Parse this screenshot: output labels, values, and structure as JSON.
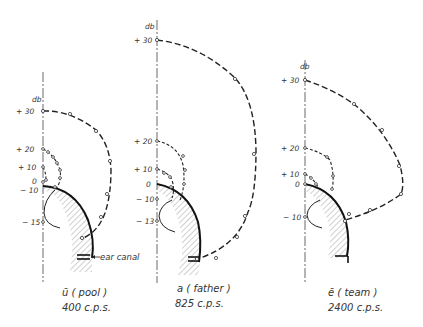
{
  "figure": {
    "unit_label": "db",
    "annotation": "ear canal",
    "panels": [
      {
        "vowel": "ū ( pool )",
        "frequency": "400 c.p.s.",
        "ticks": [
          "+ 30",
          "+ 20",
          "+ 10",
          "0",
          "− 10",
          "− 15"
        ]
      },
      {
        "vowel": "a ( father )",
        "frequency": "825 c.p.s.",
        "ticks": [
          "+ 30",
          "+ 20",
          "+ 10",
          "0",
          "− 10",
          "− 13"
        ]
      },
      {
        "vowel": "ē ( team )",
        "frequency": "2400 c.p.s.",
        "ticks": [
          "+ 30",
          "+ 20",
          "+ 10",
          "0",
          "− 10"
        ]
      }
    ]
  }
}
